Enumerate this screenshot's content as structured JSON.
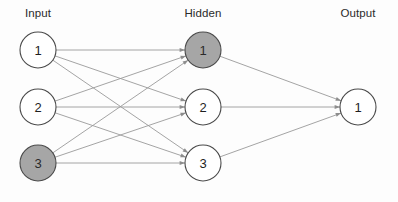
{
  "diagram": {
    "type": "neural-network",
    "width": 398,
    "height": 202,
    "background_color": "#fdfdfd",
    "edge_color": "#9a9a9a",
    "node_stroke_color": "#4a4a4a",
    "node_fill_plain": "#ffffff",
    "node_fill_highlight": "#a6a6a6",
    "node_radius": 18
  },
  "layers": [
    {
      "id": "input",
      "label": "Input",
      "label_x": 38,
      "label_y": 14,
      "x": 38,
      "nodes": [
        {
          "id": "input-1",
          "label": "1",
          "x": 38,
          "y": 50,
          "highlighted": false
        },
        {
          "id": "input-2",
          "label": "2",
          "x": 38,
          "y": 107,
          "highlighted": false
        },
        {
          "id": "input-3",
          "label": "3",
          "x": 38,
          "y": 163,
          "highlighted": true
        }
      ]
    },
    {
      "id": "hidden",
      "label": "Hidden",
      "label_x": 203,
      "label_y": 14,
      "x": 203,
      "nodes": [
        {
          "id": "hidden-1",
          "label": "1",
          "x": 203,
          "y": 50,
          "highlighted": true
        },
        {
          "id": "hidden-2",
          "label": "2",
          "x": 203,
          "y": 107,
          "highlighted": false
        },
        {
          "id": "hidden-3",
          "label": "3",
          "x": 203,
          "y": 163,
          "highlighted": false
        }
      ]
    },
    {
      "id": "output",
      "label": "Output",
      "label_x": 358,
      "label_y": 14,
      "x": 358,
      "nodes": [
        {
          "id": "output-1",
          "label": "1",
          "x": 358,
          "y": 107,
          "highlighted": false
        }
      ]
    }
  ],
  "edges": [
    {
      "id": "e-i1-h1",
      "from": "input-1",
      "to": "hidden-1"
    },
    {
      "id": "e-i1-h2",
      "from": "input-1",
      "to": "hidden-2"
    },
    {
      "id": "e-i1-h3",
      "from": "input-1",
      "to": "hidden-3"
    },
    {
      "id": "e-i2-h1",
      "from": "input-2",
      "to": "hidden-1"
    },
    {
      "id": "e-i2-h2",
      "from": "input-2",
      "to": "hidden-2"
    },
    {
      "id": "e-i2-h3",
      "from": "input-2",
      "to": "hidden-3"
    },
    {
      "id": "e-i3-h1",
      "from": "input-3",
      "to": "hidden-1"
    },
    {
      "id": "e-i3-h2",
      "from": "input-3",
      "to": "hidden-2"
    },
    {
      "id": "e-i3-h3",
      "from": "input-3",
      "to": "hidden-3"
    },
    {
      "id": "e-h1-o1",
      "from": "hidden-1",
      "to": "output-1"
    },
    {
      "id": "e-h2-o1",
      "from": "hidden-2",
      "to": "output-1"
    },
    {
      "id": "e-h3-o1",
      "from": "hidden-3",
      "to": "output-1"
    }
  ]
}
